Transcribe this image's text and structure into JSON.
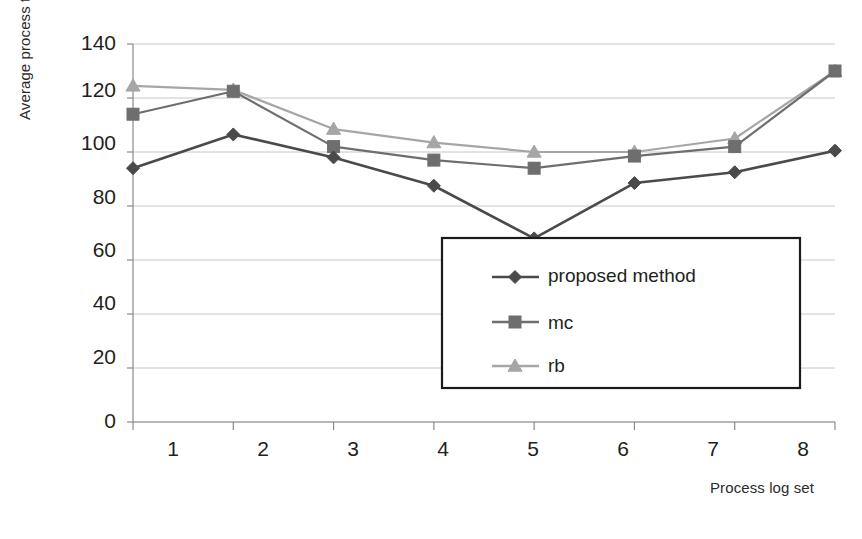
{
  "chart_data": {
    "type": "line",
    "title": "",
    "xlabel": "Process log set",
    "ylabel": "Average process time",
    "categories": [
      "1",
      "2",
      "3",
      "4",
      "5",
      "6",
      "7",
      "8"
    ],
    "xlim": [
      1,
      8
    ],
    "ylim": [
      0,
      140
    ],
    "y_ticks": [
      0,
      20,
      40,
      60,
      80,
      100,
      120,
      140
    ],
    "x_ticks": [
      1,
      2,
      3,
      4,
      5,
      6,
      7,
      8
    ],
    "grid": true,
    "legend_position": "center-right-inside",
    "series": [
      {
        "name": "proposed method",
        "marker": "diamond",
        "color": "#4a4a4a",
        "values": [
          94,
          106.5,
          98,
          87.5,
          68,
          88.5,
          92.5,
          100.5
        ]
      },
      {
        "name": "mc",
        "marker": "square",
        "color": "#6e6e6e",
        "values": [
          114,
          122.5,
          102,
          97,
          94,
          98.5,
          102,
          130
        ]
      },
      {
        "name": "rb",
        "marker": "triangle",
        "color": "#a6a6a6",
        "values": [
          124.5,
          123,
          108.5,
          103.5,
          100,
          100,
          105,
          130
        ]
      }
    ]
  },
  "axes": {
    "y_title": "Average process time",
    "x_title": "Process log set",
    "y_tick_labels": [
      "140",
      "120",
      "100",
      "80",
      "60",
      "40",
      "20",
      "0"
    ],
    "x_tick_labels": [
      "1",
      "2",
      "3",
      "4",
      "5",
      "6",
      "7",
      "8"
    ]
  },
  "legend": {
    "entries": [
      {
        "label": "proposed method",
        "marker": "diamond-marker",
        "color": "#4a4a4a"
      },
      {
        "label": "mc",
        "marker": "square-marker",
        "color": "#6e6e6e"
      },
      {
        "label": "rb",
        "marker": "triangle-marker",
        "color": "#a6a6a6"
      }
    ]
  },
  "colors": {
    "proposed_method": "#4a4a4a",
    "mc": "#6e6e6e",
    "rb": "#a6a6a6",
    "gridline": "#c8c8c8",
    "axis": "#8a8a8a",
    "legend_border": "#1a1a1a",
    "text": "#231f20"
  }
}
